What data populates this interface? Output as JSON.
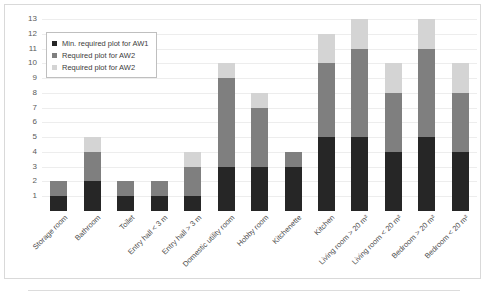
{
  "chart_data": {
    "type": "bar",
    "stacked": true,
    "title": "",
    "xlabel": "",
    "ylabel": "",
    "ylim": [
      0,
      13
    ],
    "yticks": [
      1,
      2,
      3,
      4,
      5,
      6,
      7,
      8,
      9,
      10,
      11,
      12,
      13
    ],
    "grid": true,
    "legend_position": "upper-left",
    "categories": [
      "Storage room",
      "Bathroom",
      "Toilet",
      "Entry hall < 3 m",
      "Entry hall > 3 m",
      "Domestic utility room",
      "Hobby room",
      "Kitchenette",
      "Kitchen",
      "Living room > 20 m²",
      "Living room < 20 m²",
      "Bedroom > 20 m²",
      "Bedroom < 20 m²"
    ],
    "series": [
      {
        "name": "Min. required plot for AW1",
        "color": "#262626",
        "values": [
          1,
          2,
          1,
          1,
          1,
          3,
          3,
          3,
          5,
          5,
          4,
          5,
          4
        ]
      },
      {
        "name": "Required plot for AW2",
        "color": "#7f7f7f",
        "values": [
          1,
          2,
          1,
          1,
          2,
          6,
          4,
          1,
          5,
          6,
          4,
          6,
          4
        ]
      },
      {
        "name": "Required plot for AW2",
        "color": "#d4d4d4",
        "values": [
          0,
          1,
          0,
          0,
          1,
          1,
          1,
          0,
          2,
          2,
          2,
          2,
          2
        ]
      }
    ],
    "totals": [
      2,
      5,
      2,
      2,
      4,
      10,
      8,
      4,
      12,
      13,
      10,
      13,
      10
    ]
  }
}
